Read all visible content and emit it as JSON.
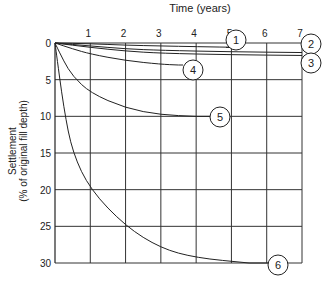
{
  "chart_data": {
    "type": "line",
    "title": "",
    "xlabel": "Time (years)",
    "ylabel": "Settlement",
    "ylabel_sub": "(% of original fill depth)",
    "x_ticks": [
      1,
      2,
      3,
      4,
      5,
      6,
      7
    ],
    "y_ticks": [
      0,
      5,
      10,
      15,
      20,
      25,
      30
    ],
    "xlim": [
      0,
      7
    ],
    "ylim": [
      0,
      30
    ],
    "y_inverted": true,
    "grid": true,
    "series": [
      {
        "name": "1",
        "points": [
          [
            0,
            0
          ],
          [
            1,
            0.1
          ],
          [
            2,
            0.3
          ],
          [
            3,
            0.4
          ],
          [
            4,
            0.5
          ],
          [
            5.3,
            0.6
          ]
        ]
      },
      {
        "name": "2",
        "points": [
          [
            0,
            0
          ],
          [
            1,
            0.4
          ],
          [
            2,
            0.8
          ],
          [
            3,
            1.0
          ],
          [
            5,
            1.2
          ],
          [
            7,
            1.3
          ]
        ]
      },
      {
        "name": "3",
        "points": [
          [
            0,
            0
          ],
          [
            1,
            0.6
          ],
          [
            2,
            1.1
          ],
          [
            3,
            1.4
          ],
          [
            5,
            1.6
          ],
          [
            7,
            1.7
          ]
        ]
      },
      {
        "name": "4",
        "points": [
          [
            0,
            0
          ],
          [
            0.5,
            0.8
          ],
          [
            1,
            1.5
          ],
          [
            2,
            2.4
          ],
          [
            3,
            2.9
          ],
          [
            3.5,
            3.0
          ]
        ]
      },
      {
        "name": "5",
        "points": [
          [
            0,
            0
          ],
          [
            0.25,
            2.5
          ],
          [
            0.5,
            4.5
          ],
          [
            1,
            6.8
          ],
          [
            2,
            8.9
          ],
          [
            3,
            9.8
          ],
          [
            4,
            10.0
          ]
        ]
      },
      {
        "name": "6",
        "points": [
          [
            0,
            0
          ],
          [
            0.25,
            9
          ],
          [
            0.5,
            15
          ],
          [
            1,
            20
          ],
          [
            2,
            25
          ],
          [
            3,
            28
          ],
          [
            4,
            29.3
          ],
          [
            5.5,
            30
          ]
        ]
      }
    ]
  },
  "labels": {
    "xlabel": "Time (years)",
    "ylabel1": "Settlement",
    "ylabel2": "(% of original fill depth)"
  }
}
